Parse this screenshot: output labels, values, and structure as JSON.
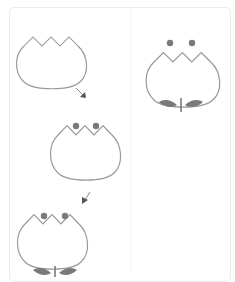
{
  "diagram": {
    "title": "",
    "colors": {
      "outline": "#9a9a9a",
      "accent": "#7a7a7a",
      "card_border": "#ececec",
      "background": "#ffffff"
    },
    "steps": [
      {
        "id": "step-1",
        "description": "tulip cup outline",
        "has_dots": false,
        "has_stem": false
      },
      {
        "id": "step-2",
        "description": "tulip cup with two dots",
        "has_dots": true,
        "has_stem": false
      },
      {
        "id": "step-3",
        "description": "tulip cup with dots, stem and leaves",
        "has_dots": true,
        "has_stem": true
      },
      {
        "id": "final",
        "description": "finished tulip",
        "has_dots": true,
        "has_stem": true
      }
    ],
    "arrows": [
      {
        "id": "arrow-1",
        "direction": "down-right"
      },
      {
        "id": "arrow-2",
        "direction": "down-left"
      }
    ]
  }
}
